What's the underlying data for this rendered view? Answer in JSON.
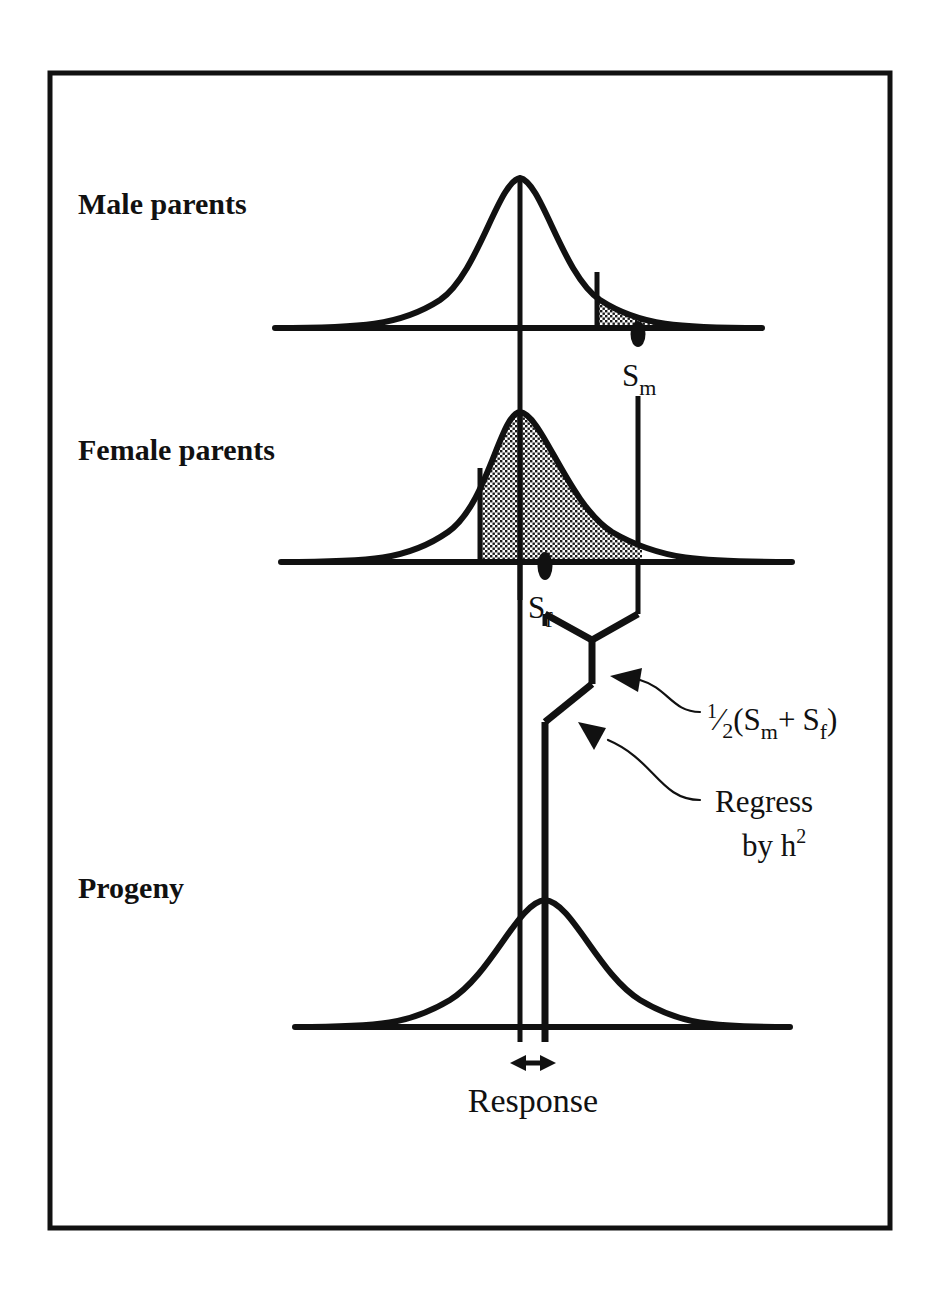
{
  "figure": {
    "background_color": "#ffffff",
    "ink_color": "#111111",
    "frame": {
      "x": 50,
      "y": 73,
      "width": 840,
      "height": 1155
    }
  },
  "panels": {
    "male": {
      "label": "Male parents",
      "label_x": 78,
      "label_y": 214,
      "baseline_y": 328,
      "baseline_x1": 275,
      "baseline_x2": 762,
      "mean_x": 520,
      "peak_y": 178,
      "curve_left_x": 360,
      "curve_right_x": 735,
      "shade_start_x": 597,
      "selection_marker_x": 638,
      "selection_label": "S",
      "selection_subscript": "m"
    },
    "female": {
      "label": "Female  parents",
      "label_x": 78,
      "label_y": 460,
      "baseline_y": 562,
      "baseline_x1": 281,
      "baseline_x2": 792,
      "mean_x": 520,
      "peak_y": 412,
      "curve_left_x": 372,
      "curve_right_x": 742,
      "shade_start_x": 480,
      "shade_end_x": 638,
      "selection_marker_x": 545,
      "selection_label": "S",
      "selection_subscript": "f"
    },
    "progeny": {
      "label": "Progeny",
      "label_x": 78,
      "label_y": 898,
      "baseline_y": 1027,
      "baseline_x1": 295,
      "baseline_x2": 790,
      "mean_x": 520,
      "progeny_mean_x": 545,
      "peak_y": 900,
      "curve_left_x": 400,
      "curve_right_x": 720,
      "response_label": "Response",
      "response_label_x": 520,
      "response_label_y": 1111,
      "response_arrow_y": 1063,
      "response_arrow_x1": 520,
      "response_arrow_x2": 546
    }
  },
  "annotations": {
    "midparent": {
      "text_prefix": "(",
      "fraction_numerator": "1",
      "fraction_denominator": "2",
      "symbol_1": "S",
      "symbol_1_sub": "m",
      "operator": "+",
      "symbol_2": "S",
      "symbol_2_sub": "f",
      "text_suffix": ")",
      "full_text": "½(Sm+ Sf)",
      "x": 700,
      "y": 722
    },
    "regress": {
      "line_1": "Regress",
      "line_2_prefix": "by h",
      "line_2_exponent": "2",
      "full_text": "Regress by h2",
      "x": 700,
      "y": 800
    }
  },
  "connector": {
    "description": "V-join from S_f line and S_m line down to midparent vertex, then regression slant to progeny mean",
    "left_top_x": 545,
    "left_top_y": 614,
    "right_top_x": 638,
    "right_top_y": 614,
    "vertex_x": 592,
    "vertex_y": 637,
    "midparent_point_y": 682,
    "slant_end_x": 545,
    "slant_end_y": 718,
    "progeny_line_end_y": 1040
  }
}
